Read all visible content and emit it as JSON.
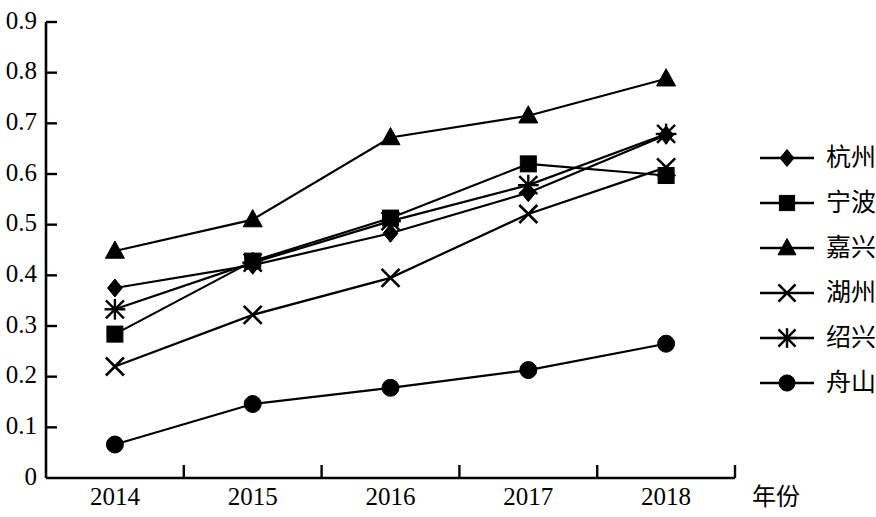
{
  "chart_data": {
    "type": "line",
    "title": "",
    "xlabel": "年份",
    "ylabel": "",
    "categories": [
      "2014",
      "2015",
      "2016",
      "2017",
      "2018"
    ],
    "ylim": [
      0,
      0.9
    ],
    "y_ticks": [
      "0",
      "0.1",
      "0.2",
      "0.3",
      "0.4",
      "0.5",
      "0.6",
      "0.7",
      "0.8",
      "0.9"
    ],
    "y_tick_values": [
      0,
      0.1,
      0.2,
      0.3,
      0.4,
      0.5,
      0.6,
      0.7,
      0.8,
      0.9
    ],
    "grid": false,
    "legend_position": "right",
    "series": [
      {
        "name": "杭州",
        "marker": "diamond",
        "values": [
          0.375,
          0.42,
          0.483,
          0.563,
          0.677
        ]
      },
      {
        "name": "宁波",
        "marker": "square",
        "values": [
          0.284,
          0.428,
          0.513,
          0.62,
          0.597
        ]
      },
      {
        "name": "嘉兴",
        "marker": "triangle",
        "values": [
          0.448,
          0.51,
          0.672,
          0.715,
          0.788
        ]
      },
      {
        "name": "湖州",
        "marker": "x",
        "values": [
          0.22,
          0.322,
          0.395,
          0.521,
          0.613
        ]
      },
      {
        "name": "绍兴",
        "marker": "star",
        "values": [
          0.333,
          0.425,
          0.507,
          0.578,
          0.679
        ]
      },
      {
        "name": "舟山",
        "marker": "circle",
        "values": [
          0.066,
          0.146,
          0.178,
          0.213,
          0.265
        ]
      }
    ]
  },
  "axis": {
    "x_axis_title": "年份"
  }
}
